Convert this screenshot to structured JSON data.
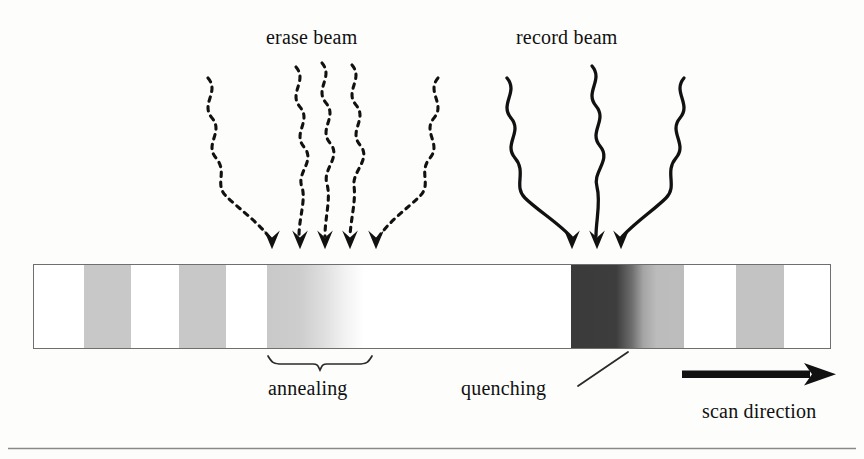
{
  "figure": {
    "background_color": "#fdfdfc",
    "ink_color": "#111111"
  },
  "beams": {
    "erase": {
      "label": "erase beam",
      "style": "dashed",
      "ray_count": 5,
      "arrow_tip_y": 248,
      "arrow_tip_x": [
        272,
        300,
        325,
        350,
        376
      ]
    },
    "record": {
      "label": "record beam",
      "style": "solid",
      "ray_count": 3,
      "arrow_tip_y": 248,
      "arrow_tip_x": [
        572,
        597,
        621
      ]
    }
  },
  "track": {
    "name": "recording-media-track",
    "x": 33,
    "y": 264,
    "width": 798,
    "height": 85,
    "fill": "#ffffff",
    "border_color": "#6f6f6f",
    "bands": [
      {
        "name": "mark-1",
        "start": 50,
        "end": 97,
        "left_color": "#c8c8c8",
        "right_color": "#c8c8c8",
        "kind": "uniform"
      },
      {
        "name": "mark-2",
        "start": 145,
        "end": 192,
        "left_color": "#c8c8c8",
        "right_color": "#c8c8c8",
        "kind": "uniform"
      },
      {
        "name": "mark-3-annealed",
        "start": 233,
        "end": 330,
        "left_color": "#c9c9c9",
        "right_color": "#ffffff",
        "kind": "gradient-fade-right"
      },
      {
        "name": "mark-4-quenched",
        "start": 537,
        "end": 650,
        "left_color": "#3a3a3a",
        "right_color": "#bdbdbd",
        "kind": "gradient-dark-to-light"
      },
      {
        "name": "mark-5",
        "start": 702,
        "end": 750,
        "left_color": "#c3c3c3",
        "right_color": "#c3c3c3",
        "kind": "uniform"
      }
    ]
  },
  "annotations": {
    "annealing": {
      "label": "annealing",
      "brace": {
        "x_start": 268,
        "x_end": 372,
        "y": 357,
        "point_x": 320
      }
    },
    "quenching": {
      "label": "quenching",
      "leader_line": {
        "x1": 578,
        "y1": 386,
        "x2": 628,
        "y2": 352
      }
    },
    "scan_direction": {
      "label": "scan direction",
      "arrow": {
        "x1": 682,
        "y1": 374,
        "x2": 836,
        "y2": 374,
        "color": "#111111"
      }
    }
  },
  "footer_rule": {
    "name": "bottom-rule",
    "y": 448,
    "color": "#8a8a8a"
  }
}
